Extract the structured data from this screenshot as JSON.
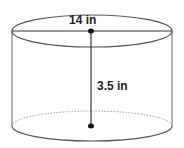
{
  "diagram": {
    "shape": "cylinder",
    "diameter_label": "14 in",
    "height_label": "3.5 in",
    "colors": {
      "outline": "#555555",
      "dotted": "#999999",
      "measure": "#222222",
      "background": "#ffffff"
    }
  }
}
